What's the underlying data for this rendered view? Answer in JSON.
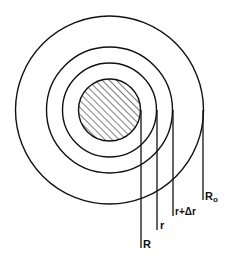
{
  "diagram": {
    "type": "concentric-circles",
    "center": {
      "x": 109.5,
      "y": 110
    },
    "stroke_color": "#111111",
    "background": "#ffffff",
    "circles": [
      {
        "id": "core",
        "radius": 31,
        "hatched": true,
        "label": "R"
      },
      {
        "id": "shell-inner",
        "radius": 47,
        "hatched": false,
        "label": "r"
      },
      {
        "id": "shell-outer",
        "radius": 63,
        "hatched": false,
        "label": "r+Δr"
      },
      {
        "id": "boundary",
        "radius": 94,
        "hatched": false,
        "label": "R₀"
      }
    ],
    "leaders": [
      {
        "label": "R",
        "x": 141,
        "y_end": 248
      },
      {
        "label": "r",
        "x": 157,
        "y_end": 230
      },
      {
        "label": "r+Δr",
        "x": 173,
        "y_end": 216
      },
      {
        "label": "R0",
        "x": 203,
        "y_end": 200
      }
    ]
  },
  "labels": {
    "R": "R",
    "r": "r",
    "r_plus_dr": "r+Δr",
    "R0_main": "R",
    "R0_sub": "o"
  }
}
